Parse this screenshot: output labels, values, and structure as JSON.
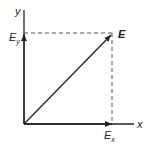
{
  "diagram": {
    "type": "vector-components",
    "colors": {
      "ink": "#222222",
      "dashed": "#555555",
      "background": "#ffffff"
    },
    "axes": {
      "x_label": "x",
      "y_label": "y"
    },
    "vector": {
      "label": "E",
      "x_component_label": "E",
      "x_component_sub": "x",
      "y_component_label": "E",
      "y_component_sub": "y"
    }
  }
}
